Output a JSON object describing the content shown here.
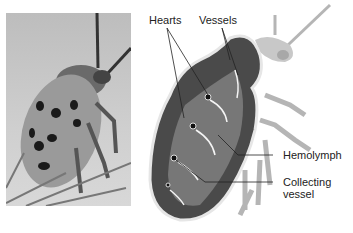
{
  "photo": {
    "subject": "spotted cucumber beetle photograph"
  },
  "diagram": {
    "labels": {
      "hearts": "Hearts",
      "vessels": "Vessels",
      "hemolymph": "Hemolymph",
      "collecting_vessel_line1": "Collecting",
      "collecting_vessel_line2": "vessel"
    }
  },
  "colors": {
    "body_dark": "#3a3a3a",
    "body_mid": "#7a7a7a",
    "silhouette": "#b5b5b5",
    "photo_bg": "#c8c8c8",
    "spots": "#1a1a1a"
  }
}
